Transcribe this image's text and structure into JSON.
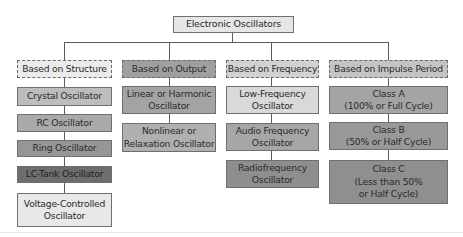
{
  "diagram": {
    "type": "hierarchy-tree",
    "root": {
      "label": "Electronic Oscillators",
      "fill": "#e6e6e6"
    },
    "categories": [
      {
        "label": "Based on Structure",
        "fill": "#ebebeb",
        "style": "dashed",
        "children": [
          {
            "label": "Crystal Oscillator",
            "fill": "#bdbdbd"
          },
          {
            "label": "RC Oscillator",
            "fill": "#a9a9a9"
          },
          {
            "label": "Ring Oscillator",
            "fill": "#969696"
          },
          {
            "label": "LC-Tank Oscillator",
            "fill": "#6e6e6e"
          },
          {
            "label": "Voltage-Controlled Oscillator",
            "fill": "#e8e8e8"
          }
        ]
      },
      {
        "label": "Based on Output",
        "fill": "#9f9f9f",
        "style": "dashed",
        "children": [
          {
            "label": "Linear or Harmonic Oscillator",
            "fill": "#a3a3a3"
          },
          {
            "label": "Nonlinear or Relaxation Oscillator",
            "fill": "#b0b0b0"
          }
        ]
      },
      {
        "label": "Based on Frequency",
        "fill": "#d2d2d2",
        "style": "dashed",
        "children": [
          {
            "label": "Low-Frequency Oscillator",
            "fill": "#d9d9d9"
          },
          {
            "label": "Audio Frequency Oscillator",
            "fill": "#a6a6a6"
          },
          {
            "label": "Radiofrequency Oscillator",
            "fill": "#8e8e8e"
          }
        ]
      },
      {
        "label": "Based on Impulse Period",
        "fill": "#c4c4c4",
        "style": "dashed",
        "children": [
          {
            "label": "Class A (100% or Full Cycle)",
            "fill": "#a4a4a4"
          },
          {
            "label": "Class B (50% or Half Cycle)",
            "fill": "#999999"
          },
          {
            "label": "Class C (Less than 50% or Half Cycle)",
            "fill": "#8f8f8f"
          }
        ]
      }
    ]
  },
  "text": {
    "root": "Electronic Oscillators",
    "c1": "Based on Structure",
    "c1_1": "Crystal Oscillator",
    "c1_2": "RC Oscillator",
    "c1_3": "Ring Oscillator",
    "c1_4": "LC-Tank Oscillator",
    "c1_5a": "Voltage-Controlled",
    "c1_5b": "Oscillator",
    "c2": "Based on Output",
    "c2_1a": "Linear or Harmonic",
    "c2_1b": "Oscillator",
    "c2_2a": "Nonlinear or",
    "c2_2b": "Relaxation Oscillator",
    "c3": "Based on Frequency",
    "c3_1a": "Low-Frequency",
    "c3_1b": "Oscillator",
    "c3_2a": "Audio Frequency",
    "c3_2b": "Oscillator",
    "c3_3a": "Radiofrequency",
    "c3_3b": "Oscillator",
    "c4": "Based on Impulse Period",
    "c4_1a": "Class A",
    "c4_1b": "(100% or Full Cycle)",
    "c4_2a": "Class B",
    "c4_2b": "(50% or Half Cycle)",
    "c4_3a": "Class C",
    "c4_3b": "(Less than 50%",
    "c4_3c": "or Half Cycle)"
  }
}
